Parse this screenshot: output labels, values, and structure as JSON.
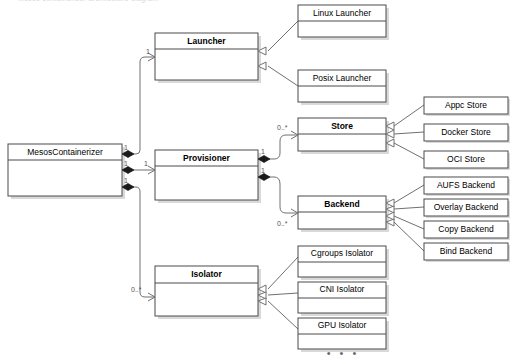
{
  "header": {
    "cut_off_caption": "Mesos containerizer architecture diagram"
  },
  "diagram": {
    "type": "uml-class-diagram",
    "colors": {
      "box_border": "#4a4a4a",
      "connector": "#707070",
      "shadow": "#d9d9d9",
      "background": "#ffffff",
      "diamond_fill": "#1a1a1a"
    },
    "classes": [
      {
        "id": "mesos-containerizer",
        "name": "MesosContainerizer",
        "bold": false,
        "compartments": 2,
        "x": 8,
        "y": 144,
        "w": 114,
        "h": 52
      },
      {
        "id": "launcher",
        "name": "Launcher",
        "bold": true,
        "compartments": 2,
        "x": 155,
        "y": 33,
        "w": 103,
        "h": 47
      },
      {
        "id": "provisioner",
        "name": "Provisioner",
        "bold": true,
        "compartments": 2,
        "x": 155,
        "y": 150,
        "w": 103,
        "h": 50
      },
      {
        "id": "isolator",
        "name": "Isolator",
        "bold": true,
        "compartments": 2,
        "x": 155,
        "y": 266,
        "w": 103,
        "h": 50
      },
      {
        "id": "linux-launcher",
        "name": "Linux Launcher",
        "bold": false,
        "compartments": 2,
        "x": 298,
        "y": 5,
        "w": 88,
        "h": 32
      },
      {
        "id": "posix-launcher",
        "name": "Posix Launcher",
        "bold": false,
        "compartments": 2,
        "x": 298,
        "y": 70,
        "w": 88,
        "h": 32
      },
      {
        "id": "store",
        "name": "Store",
        "bold": true,
        "compartments": 2,
        "x": 298,
        "y": 118,
        "w": 88,
        "h": 33
      },
      {
        "id": "backend",
        "name": "Backend",
        "bold": true,
        "compartments": 2,
        "x": 298,
        "y": 196,
        "w": 88,
        "h": 33
      },
      {
        "id": "cgroups-isolator",
        "name": "Cgroups Isolator",
        "bold": false,
        "compartments": 2,
        "x": 298,
        "y": 246,
        "w": 88,
        "h": 31
      },
      {
        "id": "cni-isolator",
        "name": "CNI Isolator",
        "bold": false,
        "compartments": 2,
        "x": 298,
        "y": 282,
        "w": 88,
        "h": 31
      },
      {
        "id": "gpu-isolator",
        "name": "GPU Isolator",
        "bold": false,
        "compartments": 2,
        "x": 298,
        "y": 318,
        "w": 88,
        "h": 31
      },
      {
        "id": "appc-store",
        "name": "Appc Store",
        "bold": false,
        "compartments": 1,
        "x": 424,
        "y": 97,
        "w": 84,
        "h": 17
      },
      {
        "id": "docker-store",
        "name": "Docker Store",
        "bold": false,
        "compartments": 1,
        "x": 424,
        "y": 124,
        "w": 84,
        "h": 17
      },
      {
        "id": "oci-store",
        "name": "OCI Store",
        "bold": false,
        "compartments": 1,
        "x": 424,
        "y": 151,
        "w": 84,
        "h": 17
      },
      {
        "id": "aufs-backend",
        "name": "AUFS Backend",
        "bold": false,
        "compartments": 1,
        "x": 424,
        "y": 177,
        "w": 84,
        "h": 17
      },
      {
        "id": "overlay-backend",
        "name": "Overlay Backend",
        "bold": false,
        "compartments": 1,
        "x": 424,
        "y": 199,
        "w": 84,
        "h": 17
      },
      {
        "id": "copy-backend",
        "name": "Copy Backend",
        "bold": false,
        "compartments": 1,
        "x": 424,
        "y": 221,
        "w": 84,
        "h": 17
      },
      {
        "id": "bind-backend",
        "name": "Bind Backend",
        "bold": false,
        "compartments": 1,
        "x": 424,
        "y": 243,
        "w": 84,
        "h": 17
      }
    ],
    "multiplicities": [
      {
        "id": "mult-launcher-target",
        "text": "1",
        "x": 146,
        "y": 52
      },
      {
        "id": "mult-mc-launcher-src",
        "text": "1",
        "x": 124,
        "y": 154
      },
      {
        "id": "mult-provisioner-target",
        "text": "1",
        "x": 144,
        "y": 175
      },
      {
        "id": "mult-mc-prov-src",
        "text": "1",
        "x": 124,
        "y": 169
      },
      {
        "id": "mult-mc-isolator-src",
        "text": "1",
        "x": 124,
        "y": 186
      },
      {
        "id": "mult-isolator-target",
        "text": "0..*",
        "x": 131,
        "y": 290
      },
      {
        "id": "mult-prov-store-src",
        "text": "1",
        "x": 261,
        "y": 158
      },
      {
        "id": "mult-prov-backend-src",
        "text": "1",
        "x": 261,
        "y": 176
      },
      {
        "id": "mult-store-target",
        "text": "0..*",
        "x": 277,
        "y": 128
      },
      {
        "id": "mult-backend-target",
        "text": "0..*",
        "x": 277,
        "y": 224
      }
    ],
    "ellipsis": {
      "id": "more-isolators",
      "text": "• • •",
      "x": 343,
      "y": 354
    },
    "relationships": [
      {
        "from": "mesos-containerizer",
        "to": "launcher",
        "kind": "composition"
      },
      {
        "from": "mesos-containerizer",
        "to": "provisioner",
        "kind": "composition"
      },
      {
        "from": "mesos-containerizer",
        "to": "isolator",
        "kind": "composition"
      },
      {
        "from": "provisioner",
        "to": "store",
        "kind": "composition"
      },
      {
        "from": "provisioner",
        "to": "backend",
        "kind": "composition"
      },
      {
        "from": "linux-launcher",
        "to": "launcher",
        "kind": "generalization"
      },
      {
        "from": "posix-launcher",
        "to": "launcher",
        "kind": "generalization"
      },
      {
        "from": "appc-store",
        "to": "store",
        "kind": "generalization"
      },
      {
        "from": "docker-store",
        "to": "store",
        "kind": "generalization"
      },
      {
        "from": "oci-store",
        "to": "store",
        "kind": "generalization"
      },
      {
        "from": "aufs-backend",
        "to": "backend",
        "kind": "generalization"
      },
      {
        "from": "overlay-backend",
        "to": "backend",
        "kind": "generalization"
      },
      {
        "from": "copy-backend",
        "to": "backend",
        "kind": "generalization"
      },
      {
        "from": "bind-backend",
        "to": "backend",
        "kind": "generalization"
      },
      {
        "from": "cgroups-isolator",
        "to": "isolator",
        "kind": "generalization"
      },
      {
        "from": "cni-isolator",
        "to": "isolator",
        "kind": "generalization"
      },
      {
        "from": "gpu-isolator",
        "to": "isolator",
        "kind": "generalization"
      }
    ]
  }
}
